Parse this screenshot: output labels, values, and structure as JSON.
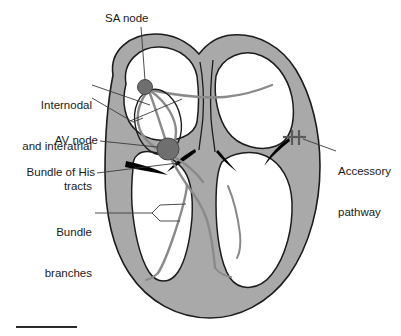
{
  "figure": {
    "type": "anatomical-diagram"
  },
  "labels": {
    "sa_node": "SA node",
    "internodal": "Internodal\nand interatrial\ntracts",
    "internodal_line1": "Internodal",
    "internodal_line2": "and interatrial",
    "internodal_line3": "tracts",
    "av_node": "AV node",
    "bundle_of_his": "Bundle of His",
    "bundle_branches_line1": "Bundle",
    "bundle_branches_line2": "branches",
    "accessory_line1": "Accessory",
    "accessory_line2": "pathway"
  },
  "parts": {
    "sa_node_name": "sinoatrial-node",
    "av_node_name": "atrioventricular-node",
    "myocardium_name": "myocardium-wall",
    "septum_name": "interventricular-septum",
    "valves_name": "atrioventricular-valves",
    "accessory_marker_name": "accessory-pathway-marker",
    "scale_bar_name": "scale-bar"
  },
  "colors": {
    "wall_fill": "#a9a9a9",
    "wall_stroke": "#1c1c1c",
    "node_fill": "#6f6f6f",
    "node_stroke": "#4a4a4a",
    "tract_stroke": "#8a8a8a",
    "valve_fill": "#000000",
    "leader_stroke": "#3a3a3a",
    "text": "#1a1a1a",
    "background": "#ffffff",
    "accessory_marker": "#5a5a5a",
    "scale_bar": "#2b2b2b"
  }
}
